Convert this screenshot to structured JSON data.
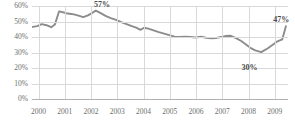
{
  "chart_data": {
    "type": "line",
    "title": "",
    "xlabel": "",
    "ylabel": "",
    "ylim": [
      0,
      60
    ],
    "xlim": [
      1999.75,
      2009.5
    ],
    "grid": true,
    "legend": false,
    "line_color": "#8c8c8c",
    "gridline_color": "#d9d9d9",
    "text_color": "#6e6e6e",
    "ytick_labels": [
      "60%",
      "50%",
      "40%",
      "30%",
      "20%",
      "10%",
      "0%"
    ],
    "ytick_values": [
      60,
      50,
      40,
      30,
      20,
      10,
      0
    ],
    "xtick_labels": [
      "2000",
      "2001",
      "2002",
      "2003",
      "2004",
      "2005",
      "2006",
      "2007",
      "2008",
      "2009"
    ],
    "xtick_values": [
      2000,
      2001,
      2002,
      2003,
      2004,
      2005,
      2006,
      2007,
      2008,
      2009
    ],
    "annotations": [
      {
        "text": "57%",
        "x": 2002.15,
        "y": 57,
        "dx": -1,
        "dy": -11
      },
      {
        "text": "30%",
        "x": 2008.0,
        "y": 30,
        "dx": -7,
        "dy": 10
      },
      {
        "text": "47%",
        "x": 2009.4,
        "y": 47,
        "dx": -12,
        "dy": -11
      }
    ],
    "x": [
      1999.78,
      1999.95,
      2000.12,
      2000.3,
      2000.48,
      2000.62,
      2000.78,
      2000.92,
      2001.05,
      2001.18,
      2001.35,
      2001.52,
      2001.7,
      2001.88,
      2002.05,
      2002.18,
      2002.35,
      2002.55,
      2002.75,
      2002.95,
      2003.15,
      2003.35,
      2003.55,
      2003.72,
      2003.88,
      2004.02,
      2004.18,
      2004.38,
      2004.58,
      2004.78,
      2004.98,
      2005.18,
      2005.38,
      2005.58,
      2005.78,
      2005.98,
      2006.18,
      2006.38,
      2006.58,
      2006.78,
      2006.95,
      2007.12,
      2007.32,
      2007.52,
      2007.72,
      2007.9,
      2008.05,
      2008.25,
      2008.48,
      2008.72,
      2008.92,
      2009.1,
      2009.28,
      2009.42
    ],
    "y": [
      46.5,
      47.0,
      48.3,
      47.6,
      46.3,
      48.0,
      56.5,
      56.0,
      55.3,
      55.0,
      54.6,
      53.8,
      52.8,
      54.0,
      55.6,
      57.0,
      55.6,
      53.6,
      52.2,
      51.0,
      49.6,
      48.3,
      47.0,
      46.0,
      44.6,
      46.0,
      45.4,
      44.3,
      43.2,
      42.2,
      41.2,
      40.2,
      40.0,
      40.2,
      40.0,
      39.7,
      40.2,
      39.5,
      39.2,
      39.4,
      40.0,
      40.6,
      40.8,
      39.3,
      37.4,
      35.2,
      33.2,
      31.4,
      30.2,
      32.6,
      35.0,
      37.2,
      38.4,
      47.0
    ]
  }
}
